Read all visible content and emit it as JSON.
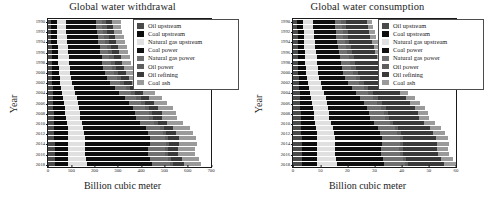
{
  "figure": {
    "xlabel": "Billion cubic meter",
    "ylabel": "Year"
  },
  "legend": {
    "items": [
      {
        "label": "Oil upstream",
        "color": "#4a4a4a"
      },
      {
        "label": "Coal upstream",
        "color": "#0d0d0d"
      },
      {
        "label": "Natural gas upstream",
        "color": "#e0e0e0"
      },
      {
        "label": "Coal power",
        "color": "#101010"
      },
      {
        "label": "Natural gas power",
        "color": "#707070"
      },
      {
        "label": "Oil power",
        "color": "#5e5e5e"
      },
      {
        "label": "Oil refining",
        "color": "#3a3a3a"
      },
      {
        "label": "Coal ash",
        "color": "#9a9a9a"
      }
    ]
  },
  "chart_data": [
    {
      "type": "bar",
      "orientation": "horizontal",
      "stacked": true,
      "title": "Global water withdrawal",
      "xlabel": "Billion cubic meter",
      "ylabel": "Year",
      "xlim": [
        0,
        700
      ],
      "xticks": [
        0,
        100,
        200,
        300,
        400,
        500,
        600,
        700
      ],
      "grid": false,
      "legend_position": "upper right",
      "categories": [
        1990,
        1991,
        1992,
        1993,
        1994,
        1995,
        1996,
        1997,
        1998,
        1999,
        2000,
        2001,
        2002,
        2003,
        2004,
        2005,
        2006,
        2007,
        2008,
        2009,
        2010,
        2011,
        2012,
        2013,
        2014,
        2015,
        2016,
        2017,
        2018
      ],
      "ytick_labels": [
        1990,
        1992,
        1994,
        1996,
        1998,
        2000,
        2002,
        2004,
        2006,
        2008,
        2010,
        2012,
        2014,
        2016,
        2018
      ],
      "series": [
        {
          "name": "Oil upstream",
          "values": [
            14,
            14,
            15,
            15,
            15,
            16,
            16,
            17,
            17,
            18,
            18,
            19,
            19,
            20,
            21,
            22,
            22,
            23,
            24,
            24,
            25,
            26,
            27,
            27,
            28,
            28,
            28,
            29,
            29
          ]
        },
        {
          "name": "Coal upstream",
          "values": [
            24,
            24,
            24,
            25,
            25,
            26,
            26,
            27,
            28,
            28,
            29,
            31,
            33,
            37,
            40,
            44,
            47,
            49,
            51,
            52,
            55,
            59,
            60,
            61,
            60,
            58,
            57,
            58,
            59
          ]
        },
        {
          "name": "Natural gas upstream",
          "values": [
            38,
            39,
            40,
            41,
            42,
            43,
            44,
            45,
            46,
            47,
            49,
            50,
            51,
            53,
            55,
            57,
            58,
            60,
            62,
            61,
            64,
            66,
            68,
            69,
            71,
            72,
            73,
            76,
            78
          ]
        },
        {
          "name": "Coal power",
          "values": [
            130,
            131,
            131,
            133,
            134,
            137,
            139,
            141,
            143,
            144,
            148,
            154,
            163,
            178,
            191,
            207,
            220,
            231,
            238,
            239,
            252,
            268,
            274,
            279,
            277,
            272,
            270,
            275,
            279
          ]
        },
        {
          "name": "Natural gas power",
          "values": [
            24,
            25,
            26,
            27,
            28,
            30,
            31,
            33,
            35,
            37,
            39,
            41,
            43,
            45,
            48,
            50,
            52,
            55,
            57,
            58,
            61,
            63,
            65,
            67,
            70,
            72,
            74,
            77,
            79
          ]
        },
        {
          "name": "Oil power",
          "values": [
            19,
            19,
            19,
            19,
            19,
            19,
            19,
            19,
            19,
            19,
            19,
            18,
            18,
            18,
            18,
            18,
            17,
            17,
            16,
            16,
            15,
            15,
            14,
            14,
            13,
            13,
            12,
            12,
            12
          ]
        },
        {
          "name": "Oil refining",
          "values": [
            28,
            28,
            29,
            29,
            30,
            30,
            31,
            31,
            32,
            32,
            33,
            33,
            34,
            35,
            36,
            37,
            38,
            39,
            40,
            39,
            41,
            42,
            43,
            44,
            45,
            45,
            46,
            47,
            48
          ]
        },
        {
          "name": "Coal ash",
          "values": [
            35,
            35,
            35,
            36,
            36,
            37,
            37,
            38,
            38,
            39,
            40,
            41,
            44,
            48,
            51,
            56,
            59,
            62,
            64,
            64,
            68,
            72,
            74,
            75,
            74,
            73,
            72,
            74,
            75
          ]
        }
      ]
    },
    {
      "type": "bar",
      "orientation": "horizontal",
      "stacked": true,
      "title": "Global water consumption",
      "xlabel": "Billion cubic meter",
      "ylabel": "Year",
      "xlim": [
        0,
        60
      ],
      "xticks": [
        0,
        10,
        20,
        30,
        40,
        50,
        60
      ],
      "grid": false,
      "legend_position": "upper right",
      "categories": [
        1990,
        1991,
        1992,
        1993,
        1994,
        1995,
        1996,
        1997,
        1998,
        1999,
        2000,
        2001,
        2002,
        2003,
        2004,
        2005,
        2006,
        2007,
        2008,
        2009,
        2010,
        2011,
        2012,
        2013,
        2014,
        2015,
        2016,
        2017,
        2018
      ],
      "ytick_labels": [
        1990,
        1992,
        1994,
        1996,
        1998,
        2000,
        2002,
        2004,
        2006,
        2008,
        2010,
        2012,
        2014,
        2016,
        2018
      ],
      "series": [
        {
          "name": "Oil upstream",
          "values": [
            1.6,
            1.6,
            1.7,
            1.7,
            1.7,
            1.8,
            1.8,
            1.9,
            1.9,
            2.0,
            2.0,
            2.1,
            2.2,
            2.3,
            2.4,
            2.5,
            2.6,
            2.7,
            2.8,
            2.8,
            2.9,
            3.0,
            3.1,
            3.2,
            3.2,
            3.3,
            3.3,
            3.4,
            3.4
          ]
        },
        {
          "name": "Coal upstream",
          "values": [
            2.2,
            2.2,
            2.3,
            2.3,
            2.4,
            2.4,
            2.5,
            2.6,
            2.6,
            2.7,
            2.8,
            3.0,
            3.2,
            3.5,
            3.8,
            4.2,
            4.4,
            4.6,
            4.8,
            4.9,
            5.2,
            5.5,
            5.7,
            5.8,
            5.7,
            5.5,
            5.4,
            5.5,
            5.6
          ]
        },
        {
          "name": "Natural gas upstream",
          "values": [
            3.5,
            3.6,
            3.7,
            3.8,
            3.9,
            4.0,
            4.1,
            4.2,
            4.3,
            4.4,
            4.5,
            4.6,
            4.8,
            4.9,
            5.1,
            5.3,
            5.4,
            5.6,
            5.8,
            5.7,
            6.0,
            6.2,
            6.3,
            6.5,
            6.6,
            6.7,
            6.9,
            7.1,
            7.3
          ]
        },
        {
          "name": "Coal power",
          "values": [
            8.0,
            8.1,
            8.1,
            8.2,
            8.3,
            8.5,
            8.6,
            8.7,
            8.9,
            8.9,
            9.2,
            9.5,
            10.1,
            11.0,
            11.8,
            12.8,
            13.6,
            14.3,
            14.7,
            14.8,
            15.6,
            16.6,
            17.0,
            17.3,
            17.2,
            16.8,
            16.7,
            17.0,
            17.3
          ]
        },
        {
          "name": "Natural gas power",
          "values": [
            2.3,
            2.4,
            2.5,
            2.6,
            2.7,
            2.9,
            3.0,
            3.2,
            3.4,
            3.5,
            3.7,
            3.9,
            4.1,
            4.3,
            4.6,
            4.8,
            5.0,
            5.3,
            5.5,
            5.6,
            5.9,
            6.1,
            6.3,
            6.5,
            6.7,
            6.9,
            7.1,
            7.4,
            7.6
          ]
        },
        {
          "name": "Oil power",
          "values": [
            1.8,
            1.8,
            1.8,
            1.8,
            1.8,
            1.8,
            1.8,
            1.8,
            1.8,
            1.8,
            1.8,
            1.7,
            1.7,
            1.7,
            1.7,
            1.7,
            1.6,
            1.6,
            1.5,
            1.5,
            1.4,
            1.4,
            1.3,
            1.3,
            1.2,
            1.2,
            1.2,
            1.1,
            1.1
          ]
        },
        {
          "name": "Oil refining",
          "values": [
            7.8,
            7.9,
            8.0,
            8.1,
            8.3,
            8.4,
            8.5,
            8.7,
            8.8,
            9.0,
            9.1,
            9.3,
            9.5,
            9.7,
            10.0,
            10.3,
            10.6,
            10.8,
            11.1,
            11.0,
            11.4,
            11.7,
            11.9,
            12.2,
            12.4,
            12.6,
            12.8,
            13.0,
            13.3
          ]
        },
        {
          "name": "Coal ash",
          "values": [
            2.0,
            2.0,
            2.0,
            2.1,
            2.1,
            2.1,
            2.2,
            2.2,
            2.2,
            2.3,
            2.3,
            2.4,
            2.5,
            2.8,
            3.0,
            3.2,
            3.4,
            3.6,
            3.7,
            3.7,
            3.9,
            4.1,
            4.3,
            4.3,
            4.3,
            4.2,
            4.2,
            4.3,
            4.3
          ]
        }
      ]
    }
  ]
}
